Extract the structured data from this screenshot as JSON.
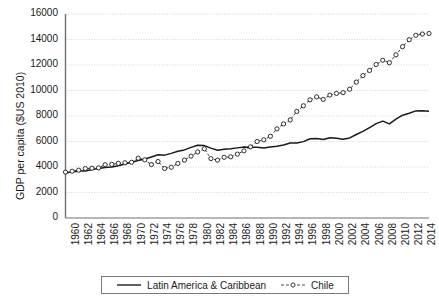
{
  "chart_data": {
    "type": "line",
    "title": "",
    "xlabel": "",
    "ylabel": "GDP per capita ($US 2010)",
    "ylim": [
      0,
      16000
    ],
    "ytick_values": [
      0,
      2000,
      4000,
      6000,
      8000,
      10000,
      12000,
      14000,
      16000
    ],
    "ytick_labels": [
      "0",
      "2000",
      "4000",
      "6000",
      "8000",
      "10000",
      "12000",
      "14000",
      "16000"
    ],
    "xlim": [
      1960,
      2015
    ],
    "xtick_labels": [
      "1960",
      "1962",
      "1964",
      "1966",
      "1968",
      "1970",
      "1972",
      "1974",
      "1976",
      "1978",
      "1980",
      "1982",
      "1984",
      "1986",
      "1988",
      "1990",
      "1992",
      "1994",
      "1996",
      "1998",
      "2000",
      "2002",
      "2004",
      "2006",
      "2008",
      "2010",
      "2012",
      "2014"
    ],
    "grid": "horizontal-dotted",
    "legend_position": "bottom-center",
    "x": [
      1960,
      1961,
      1962,
      1963,
      1964,
      1965,
      1966,
      1967,
      1968,
      1969,
      1970,
      1971,
      1972,
      1973,
      1974,
      1975,
      1976,
      1977,
      1978,
      1979,
      1980,
      1981,
      1982,
      1983,
      1984,
      1985,
      1986,
      1987,
      1988,
      1989,
      1990,
      1991,
      1992,
      1993,
      1994,
      1995,
      1996,
      1997,
      1998,
      1999,
      2000,
      2001,
      2002,
      2003,
      2004,
      2005,
      2006,
      2007,
      2008,
      2009,
      2010,
      2011,
      2012,
      2013,
      2014,
      2015
    ],
    "series": [
      {
        "name": "Latin America & Caribbean",
        "style": "solid",
        "marker": "none",
        "color": "#1a1a1a",
        "values": [
          3550,
          3610,
          3680,
          3690,
          3810,
          3880,
          3960,
          4000,
          4100,
          4230,
          4380,
          4510,
          4630,
          4790,
          4960,
          4930,
          5070,
          5230,
          5340,
          5540,
          5700,
          5680,
          5480,
          5310,
          5400,
          5430,
          5500,
          5560,
          5540,
          5540,
          5490,
          5570,
          5620,
          5720,
          5880,
          5880,
          5990,
          6220,
          6230,
          6160,
          6300,
          6260,
          6180,
          6280,
          6550,
          6790,
          7090,
          7400,
          7600,
          7380,
          7750,
          8060,
          8220,
          8400,
          8420,
          8380
        ]
      },
      {
        "name": "Chile",
        "style": "dashed",
        "marker": "circle",
        "color": "#1a1a1a",
        "values": [
          3600,
          3670,
          3750,
          3880,
          3900,
          3930,
          4180,
          4210,
          4290,
          4330,
          4370,
          4690,
          4560,
          4190,
          4430,
          3880,
          3980,
          4280,
          4540,
          4850,
          5180,
          5430,
          4660,
          4540,
          4760,
          4800,
          5010,
          5270,
          5580,
          6000,
          6130,
          6410,
          6990,
          7380,
          7690,
          8360,
          8800,
          9270,
          9500,
          9300,
          9640,
          9770,
          9830,
          10100,
          10660,
          11170,
          11570,
          12040,
          12370,
          12180,
          12800,
          13440,
          13980,
          14330,
          14430,
          14470
        ]
      }
    ]
  },
  "axis": {
    "y_title": "GDP per capita ($US 2010)"
  },
  "legend": {
    "entries": [
      {
        "label": "Latin America & Caribbean",
        "style": "solid"
      },
      {
        "label": "Chile",
        "style": "dashed-marker"
      }
    ]
  },
  "colors": {
    "line": "#1a1a1a",
    "grid": "#c8c8c8",
    "axis": "#6f6f6f",
    "background": "#ffffff"
  }
}
